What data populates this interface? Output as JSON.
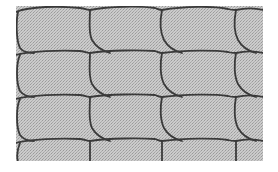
{
  "figure": {
    "background_color": "#ffffff",
    "fill_color": "#c4c4c4",
    "line_color": "#3a3a3a",
    "region": {
      "x": 16,
      "y": 6,
      "width": 247,
      "height": 155
    },
    "rows": [
      10,
      53,
      97,
      141
    ],
    "columns": [
      16,
      90,
      161,
      234,
      263
    ]
  }
}
